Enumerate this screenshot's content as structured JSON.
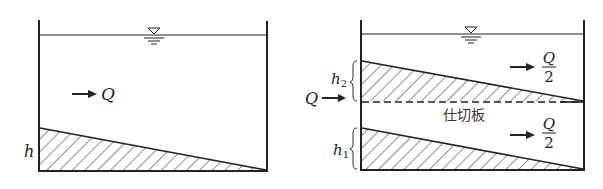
{
  "figure": {
    "left_panel": {
      "flow_label": "Q",
      "sludge_depth_label": "h"
    },
    "right_panel": {
      "inlet_flow_label": "Q",
      "upper_depth_label": "h",
      "upper_depth_sub": "2",
      "lower_depth_label": "h",
      "lower_depth_sub": "1",
      "upper_flow_num": "Q",
      "upper_flow_den": "2",
      "lower_flow_num": "Q",
      "lower_flow_den": "2",
      "partition_label": "仕切板"
    },
    "colors": {
      "line": "#222222",
      "hatch": "#333333",
      "background": "#ffffff"
    }
  }
}
